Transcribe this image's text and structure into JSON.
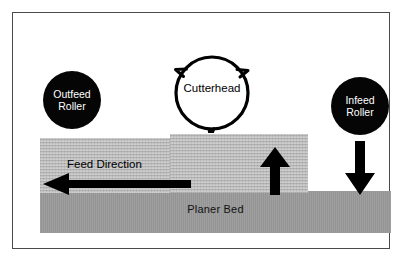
{
  "diagram": {
    "components": {
      "outfeed_roller": {
        "label_line1": "Outfeed",
        "label_line2": "Roller",
        "color": "#050505",
        "text_color": "#ffffff"
      },
      "infeed_roller": {
        "label_line1": "Infeed",
        "label_line2": "Roller",
        "color": "#050505",
        "text_color": "#ffffff"
      },
      "cutterhead": {
        "label": "Cutterhead",
        "fill": "#ffffff",
        "stroke": "#000000",
        "knife_count": 3
      },
      "planer_bed": {
        "label": "Planer Bed",
        "color": "#9a9a9a"
      },
      "workpiece": {
        "color": "#bdbdbd",
        "texture": "wood-grain-horizontal"
      }
    },
    "annotations": {
      "feed_direction": {
        "label": "Feed Direction",
        "arrow": "arrow-left"
      },
      "cut_force": {
        "arrow": "arrow-up"
      },
      "infeed_pressure": {
        "arrow": "arrow-down"
      }
    },
    "frame": {
      "border_color": "#4a4a4a",
      "background": "#ffffff"
    }
  }
}
